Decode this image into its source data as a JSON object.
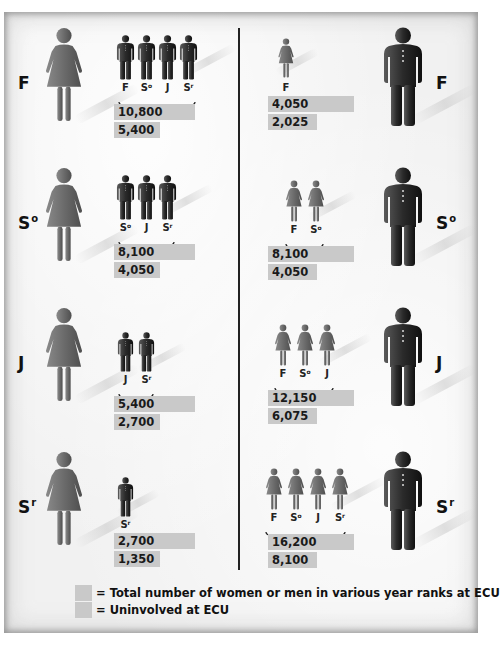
{
  "chart_data": {
    "type": "table",
    "title": "",
    "legend": [
      {
        "swatch": "wide-bar",
        "label": "= Total number of women or men in various year ranks at ECU"
      },
      {
        "swatch": "short-bar",
        "label": "= Uninvolved at ECU"
      }
    ],
    "women_side": [
      {
        "rank": "F",
        "rank_base": "F",
        "rank_sup": "",
        "partner_ranks": [
          "F",
          "S°",
          "J",
          "Sʳ"
        ],
        "total": 10800,
        "uninvolved": 5400
      },
      {
        "rank": "S°",
        "rank_base": "S",
        "rank_sup": "o",
        "partner_ranks": [
          "S°",
          "J",
          "Sʳ"
        ],
        "total": 8100,
        "uninvolved": 4050
      },
      {
        "rank": "J",
        "rank_base": "J",
        "rank_sup": "",
        "partner_ranks": [
          "J",
          "Sʳ"
        ],
        "total": 5400,
        "uninvolved": 2700
      },
      {
        "rank": "Sʳ",
        "rank_base": "S",
        "rank_sup": "r",
        "partner_ranks": [
          "Sʳ"
        ],
        "total": 2700,
        "uninvolved": 1350
      }
    ],
    "men_side": [
      {
        "rank": "F",
        "rank_base": "F",
        "rank_sup": "",
        "partner_ranks": [
          "F"
        ],
        "total": 4050,
        "uninvolved": 2025
      },
      {
        "rank": "S°",
        "rank_base": "S",
        "rank_sup": "o",
        "partner_ranks": [
          "F",
          "S°"
        ],
        "total": 8100,
        "uninvolved": 4050
      },
      {
        "rank": "J",
        "rank_base": "J",
        "rank_sup": "",
        "partner_ranks": [
          "F",
          "S°",
          "J"
        ],
        "total": 12150,
        "uninvolved": 6075
      },
      {
        "rank": "Sʳ",
        "rank_base": "S",
        "rank_sup": "r",
        "partner_ranks": [
          "F",
          "S°",
          "J",
          "Sʳ"
        ],
        "total": 16200,
        "uninvolved": 8100
      }
    ]
  },
  "rows": {
    "left": [
      {
        "rank_base": "F",
        "rank_sup": "",
        "labels": [
          {
            "b": "F",
            "s": ""
          },
          {
            "b": "S",
            "s": "o"
          },
          {
            "b": "J",
            "s": ""
          },
          {
            "b": "S",
            "s": "r"
          }
        ],
        "total": "10,800",
        "uninvolved": "5,400"
      },
      {
        "rank_base": "S",
        "rank_sup": "o",
        "labels": [
          {
            "b": "S",
            "s": "o"
          },
          {
            "b": "J",
            "s": ""
          },
          {
            "b": "S",
            "s": "r"
          }
        ],
        "total": "8,100",
        "uninvolved": "4,050"
      },
      {
        "rank_base": "J",
        "rank_sup": "",
        "labels": [
          {
            "b": "J",
            "s": ""
          },
          {
            "b": "S",
            "s": "r"
          }
        ],
        "total": "5,400",
        "uninvolved": "2,700"
      },
      {
        "rank_base": "S",
        "rank_sup": "r",
        "labels": [
          {
            "b": "S",
            "s": "r"
          }
        ],
        "total": "2,700",
        "uninvolved": "1,350"
      }
    ],
    "right": [
      {
        "rank_base": "F",
        "rank_sup": "",
        "labels": [
          {
            "b": "F",
            "s": ""
          }
        ],
        "total": "4,050",
        "uninvolved": "2,025"
      },
      {
        "rank_base": "S",
        "rank_sup": "o",
        "labels": [
          {
            "b": "F",
            "s": ""
          },
          {
            "b": "S",
            "s": "o"
          }
        ],
        "total": "8,100",
        "uninvolved": "4,050"
      },
      {
        "rank_base": "J",
        "rank_sup": "",
        "labels": [
          {
            "b": "F",
            "s": ""
          },
          {
            "b": "S",
            "s": "o"
          },
          {
            "b": "J",
            "s": ""
          }
        ],
        "total": "12,150",
        "uninvolved": "6,075"
      },
      {
        "rank_base": "S",
        "rank_sup": "r",
        "labels": [
          {
            "b": "F",
            "s": ""
          },
          {
            "b": "S",
            "s": "o"
          },
          {
            "b": "J",
            "s": ""
          },
          {
            "b": "S",
            "s": "r"
          }
        ],
        "total": "16,200",
        "uninvolved": "8,100"
      }
    ]
  },
  "legend": {
    "total_label": "= Total number of women or men in various year ranks at ECU",
    "uninvolved_label": "= Uninvolved at ECU"
  },
  "colors": {
    "bar": "#c9c9c9",
    "woman": "#6b6b6b",
    "man": "#2a2a2a",
    "divider": "#222222"
  }
}
